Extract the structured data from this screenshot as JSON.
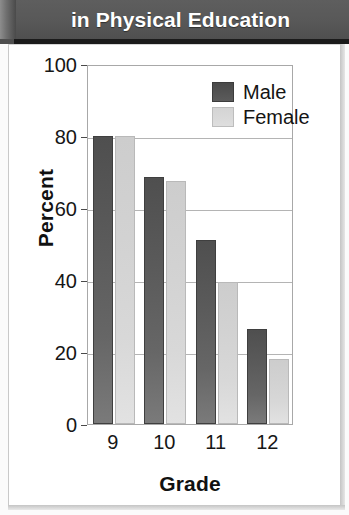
{
  "banner": {
    "title": "in Physical Education",
    "background_color": "#585858",
    "text_color": "#ffffff"
  },
  "chart_data": {
    "type": "bar",
    "title": "in Physical Education",
    "xlabel": "Grade",
    "ylabel": "Percent",
    "categories": [
      "9",
      "10",
      "11",
      "12"
    ],
    "series": [
      {
        "name": "Male",
        "color": "#5a5a5a",
        "values": [
          80,
          68.5,
          51,
          26.5
        ]
      },
      {
        "name": "Female",
        "color": "#d6d6d6",
        "values": [
          80,
          67.5,
          39.5,
          18
        ]
      }
    ],
    "ylim": [
      0,
      100
    ],
    "yticks": [
      0,
      20,
      40,
      60,
      80,
      100
    ],
    "ytick_labels": [
      "0",
      "20",
      "40",
      "60",
      "80",
      "100"
    ],
    "grid": true,
    "grid_axis": "y",
    "legend_position": "top-right-inside"
  },
  "legend": {
    "entries": [
      {
        "label": "Male",
        "key": "male"
      },
      {
        "label": "Female",
        "key": "female"
      }
    ]
  }
}
